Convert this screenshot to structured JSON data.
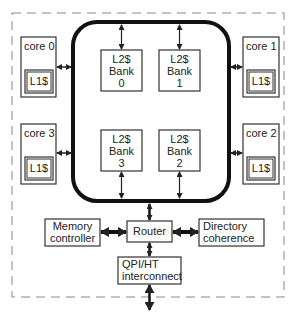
{
  "diagram": {
    "cores": [
      {
        "label": "core 0",
        "cache": "L1$"
      },
      {
        "label": "core 1",
        "cache": "L1$"
      },
      {
        "label": "core 2",
        "cache": "L1$"
      },
      {
        "label": "core 3",
        "cache": "L1$"
      }
    ],
    "banks": [
      {
        "line1": "L2$",
        "line2": "Bank",
        "line3": "0"
      },
      {
        "line1": "L2$",
        "line2": "Bank",
        "line3": "1"
      },
      {
        "line1": "L2$",
        "line2": "Bank",
        "line3": "2"
      },
      {
        "line1": "L2$",
        "line2": "Bank",
        "line3": "3"
      }
    ],
    "memory_controller": {
      "line1": "Memory",
      "line2": "controller"
    },
    "router": {
      "label": "Router"
    },
    "directory": {
      "line1": "Directory",
      "line2": "coherence"
    },
    "interconnect": {
      "line1": "QPI/HT",
      "line2": "interconnect"
    },
    "colors": {
      "stroke": "#333333",
      "text": "#222222",
      "dashed": "#888888"
    }
  }
}
